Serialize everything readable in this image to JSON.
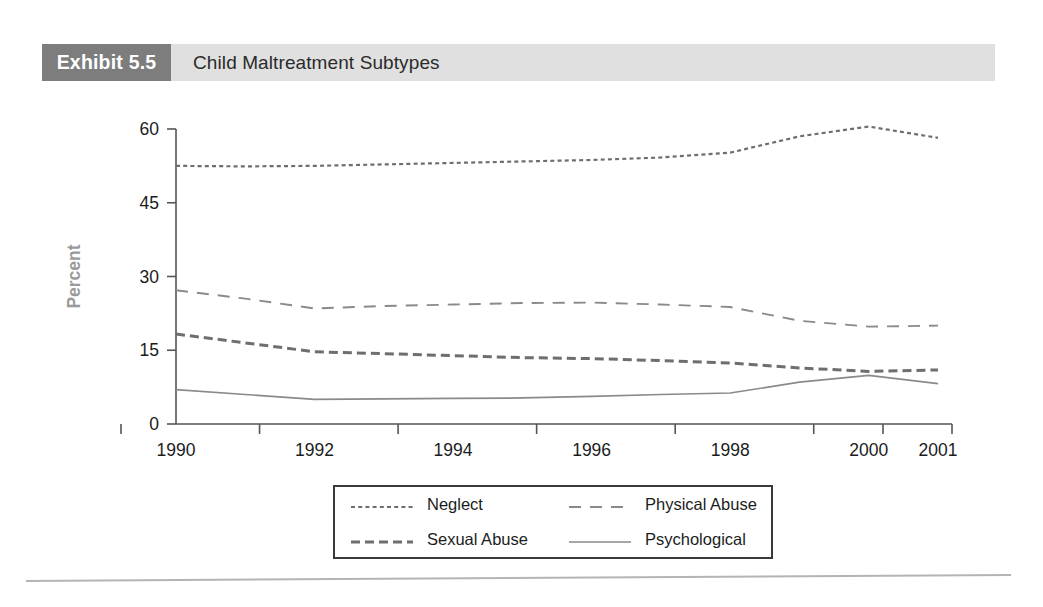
{
  "exhibit": {
    "tag": "Exhibit 5.5",
    "title": "Child Maltreatment Subtypes",
    "tag_bg": "#7d7d7d",
    "bar_bg": "#e0e0e0"
  },
  "legend": {
    "items": [
      {
        "label": "Neglect",
        "style": "dotted",
        "color": "#6e6e6e"
      },
      {
        "label": "Physical Abuse",
        "style": "dashed-long",
        "color": "#8a8a8a"
      },
      {
        "label": "Sexual Abuse",
        "style": "dashed-bold",
        "color": "#6e6e6e"
      },
      {
        "label": "Psychological",
        "style": "solid",
        "color": "#8a8a8a"
      }
    ]
  },
  "chart_data": {
    "type": "line",
    "title": "Child Maltreatment Subtypes",
    "xlabel": "",
    "ylabel": "Percent",
    "x": [
      1990,
      1991,
      1992,
      1993,
      1994,
      1995,
      1996,
      1997,
      1998,
      1999,
      2000,
      2001
    ],
    "tick_labels": [
      "1990",
      "1992",
      "1994",
      "1996",
      "1998",
      "2000",
      "2001"
    ],
    "tick_values": [
      1990,
      1992,
      1994,
      1996,
      1998,
      2000,
      2001
    ],
    "ylim": [
      0,
      60
    ],
    "yticks": [
      0,
      15,
      30,
      45,
      60
    ],
    "ytick_labels": [
      "0",
      "15",
      "30",
      "45",
      "60"
    ],
    "grid": false,
    "legend_position": "bottom",
    "series": [
      {
        "name": "Neglect",
        "style": "dotted",
        "color": "#6e6e6e",
        "values": [
          52.5,
          52.4,
          52.5,
          52.8,
          53.1,
          53.4,
          53.7,
          54.2,
          55.2,
          58.5,
          60.5,
          58.2
        ]
      },
      {
        "name": "Physical Abuse",
        "style": "dashed-long",
        "color": "#8a8a8a",
        "values": [
          27.2,
          25.5,
          23.5,
          24.0,
          24.3,
          24.6,
          24.7,
          24.3,
          23.8,
          21.0,
          19.8,
          20.0
        ]
      },
      {
        "name": "Sexual Abuse",
        "style": "dashed-bold",
        "color": "#6e6e6e",
        "values": [
          18.3,
          16.5,
          14.7,
          14.3,
          13.9,
          13.5,
          13.3,
          12.9,
          12.4,
          11.4,
          10.7,
          11.0
        ]
      },
      {
        "name": "Psychological",
        "style": "solid",
        "color": "#8a8a8a",
        "values": [
          7.0,
          6.0,
          5.0,
          5.1,
          5.2,
          5.3,
          5.6,
          6.0,
          6.3,
          8.5,
          9.9,
          8.2
        ]
      }
    ]
  }
}
